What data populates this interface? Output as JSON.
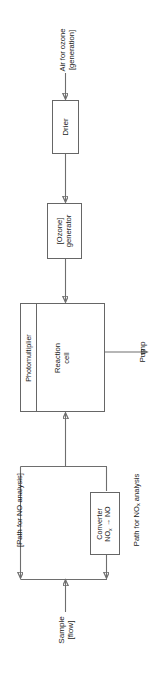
{
  "diagram": {
    "orientation": "rotated-90-ccw",
    "background_color": "#ffffff",
    "line_color": "#6e6e6e",
    "text_color": "#1a1a1a"
  },
  "nodes": {
    "drier": {
      "label": "Drier"
    },
    "ozone_generator": {
      "line1": "[Ozone]",
      "line2": "generator"
    },
    "reaction_cell": {
      "line1": "Reaction",
      "line2": "cell"
    },
    "photomultiplier": {
      "label": "Photomultiplier"
    },
    "converter": {
      "line1": "Converter",
      "line2_pre": "NO",
      "line2_sub": "x",
      "line2_post": " → NO"
    }
  },
  "labels": {
    "air_for_ozone": {
      "line1": "Air for ozone",
      "line2": "[generation]"
    },
    "pump": {
      "label": "Pump"
    },
    "path_for_no": {
      "label": "[Path for NO analysis]"
    },
    "path_for_nox": {
      "pre": "Path for NO",
      "sub": "x",
      "post": " analysis"
    },
    "sample": {
      "line1": "Sample",
      "line2": "[flow]"
    }
  },
  "flow": {
    "arrows": [
      {
        "from": "air_for_ozone",
        "to": "drier"
      },
      {
        "from": "drier",
        "to": "ozone_generator"
      },
      {
        "from": "ozone_generator",
        "to": "reaction_cell"
      },
      {
        "from": "reaction_cell",
        "to": "pump"
      },
      {
        "from": "sample",
        "to": "split_junction"
      },
      {
        "from": "split_junction",
        "to": "path_for_no"
      },
      {
        "from": "split_junction",
        "to": "converter"
      },
      {
        "from": "converter",
        "to": "merge_junction"
      },
      {
        "from": "path_for_no",
        "to": "merge_junction"
      },
      {
        "from": "merge_junction",
        "to": "reaction_cell"
      }
    ]
  }
}
